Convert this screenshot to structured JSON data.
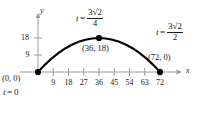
{
  "figure": {
    "type": "parametric-curve-plot",
    "background_color": "#ffffff",
    "curve_color": "#000000",
    "axis_color": "#9a9a9a",
    "text_color": "#1a1a1a"
  },
  "axes": {
    "x_axis_name": "x",
    "y_axis_name": "y",
    "x_ticks": [
      "9",
      "18",
      "27",
      "36",
      "45",
      "54",
      "63",
      "72"
    ],
    "x_tick_values": [
      9,
      18,
      27,
      36,
      45,
      54,
      63,
      72
    ],
    "y_ticks": [
      "9",
      "18"
    ],
    "y_tick_values": [
      9,
      18
    ],
    "xlim": [
      0,
      76
    ],
    "ylim": [
      0,
      22
    ]
  },
  "labels": {
    "origin_point": "(0, 0)",
    "origin_time_var": "t",
    "origin_time_eq": "=",
    "origin_time_value": "0",
    "apex_point": "(36, 18)",
    "end_point": "(72, 0)",
    "apex_time_var": "t",
    "apex_time_eq": "=",
    "apex_time_numerator": "3√2",
    "apex_time_denominator": "4",
    "end_time_var": "t",
    "end_time_eq": "=",
    "end_time_numerator": "3√2",
    "end_time_denominator": "2"
  },
  "chart_data": {
    "type": "line",
    "title": "",
    "xlabel": "x",
    "ylabel": "y",
    "xlim": [
      0,
      76
    ],
    "ylim": [
      0,
      22
    ],
    "grid": false,
    "legend": null,
    "xticks": [
      9,
      18,
      27,
      36,
      45,
      54,
      63,
      72
    ],
    "yticks": [
      9,
      18
    ],
    "series": [
      {
        "name": "projectile-path",
        "x": [
          0,
          4,
          8,
          12,
          16,
          20,
          24,
          28,
          32,
          36,
          40,
          44,
          48,
          52,
          56,
          60,
          64,
          68,
          72
        ],
        "y": [
          0,
          3.78,
          7.11,
          10.0,
          12.44,
          14.44,
          16.0,
          17.11,
          17.78,
          18.0,
          17.78,
          17.11,
          16.0,
          14.44,
          12.44,
          10.0,
          7.11,
          3.78,
          0
        ]
      }
    ],
    "markers": [
      {
        "label": "(0, 0)",
        "x": 0,
        "y": 0
      },
      {
        "label": "(36, 18)",
        "x": 36,
        "y": 18
      },
      {
        "label": "(72, 0)",
        "x": 72,
        "y": 0
      }
    ],
    "annotations": [
      {
        "text": "t = 0",
        "x": 0,
        "y": 0
      },
      {
        "text": "t = 3√2/4",
        "x": 36,
        "y": 18
      },
      {
        "text": "t = 3√2/2",
        "x": 72,
        "y": 0
      }
    ]
  }
}
